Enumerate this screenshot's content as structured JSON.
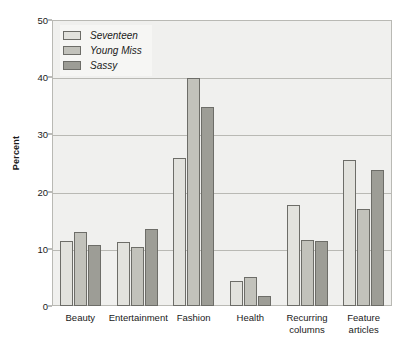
{
  "chart_data": {
    "type": "bar",
    "title": "",
    "xlabel": "",
    "ylabel": "Percent",
    "ylim": [
      0,
      50
    ],
    "yticks": [
      0,
      10,
      20,
      30,
      40,
      50
    ],
    "grid": true,
    "legend_position": "top-left",
    "categories": [
      "Beauty",
      "Entertainment",
      "Fashion",
      "Health",
      "Recurring\ncolumns",
      "Feature\narticles"
    ],
    "series": [
      {
        "name": "Seventeen",
        "color": "#e2e2dd",
        "values": [
          11.3,
          11.2,
          25.8,
          4.3,
          17.7,
          25.5
        ]
      },
      {
        "name": "Young Miss",
        "color": "#c2c2bb",
        "values": [
          13.0,
          10.3,
          39.8,
          5.0,
          11.5,
          17.0
        ]
      },
      {
        "name": "Sassy",
        "color": "#9d9d96",
        "values": [
          10.6,
          13.5,
          34.8,
          1.7,
          11.4,
          23.8
        ]
      }
    ]
  },
  "style": {
    "plot_background": "#f0f0ee",
    "grid_color": "#b9b9b4",
    "bar_outline": "#6d6d68",
    "text_color": "#1a1a1a",
    "legend_background": "#f6f6f4"
  }
}
